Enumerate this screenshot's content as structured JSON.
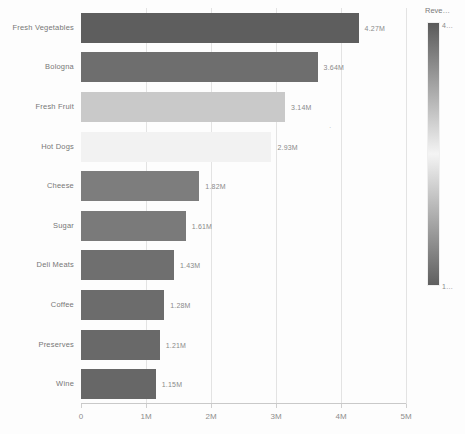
{
  "chart_data": {
    "type": "bar",
    "orientation": "horizontal",
    "title": "",
    "xlabel": "",
    "ylabel": "",
    "categories": [
      "Fresh Vegetables",
      "Bologna",
      "Fresh Fruit",
      "Hot Dogs",
      "Cheese",
      "Sugar",
      "Deli Meats",
      "Coffee",
      "Preserves",
      "Wine"
    ],
    "values": [
      4.27,
      3.64,
      3.14,
      2.93,
      1.82,
      1.61,
      1.43,
      1.28,
      1.21,
      1.15
    ],
    "value_labels": [
      "4.27M",
      "3.64M",
      "3.14M",
      "2.93M",
      "1.82M",
      "1.61M",
      "1.43M",
      "1.28M",
      "1.21M",
      "1.15M"
    ],
    "bar_colors": [
      "#5e5e5e",
      "#6e6e6e",
      "#c9c9c9",
      "#f2f2f2",
      "#7d7d7d",
      "#7a7a7a",
      "#6f6f6f",
      "#6c6c6c",
      "#696969",
      "#676767"
    ],
    "xlim": [
      0,
      5
    ],
    "xticks": [
      0,
      1,
      2,
      3,
      4,
      5
    ],
    "xtick_labels": [
      "0",
      "1M",
      "2M",
      "3M",
      "4M",
      "5M"
    ],
    "grid": true,
    "grid_axis": "x",
    "legend_position": "right"
  },
  "legend": {
    "title": "Reve…",
    "top_label": "4…",
    "bottom_label": "1…",
    "gradient_top": "#5a5a5a",
    "gradient_mid": "#f4f4f4",
    "gradient_bottom": "#5f5f5f"
  },
  "stray": {
    "mark": "·"
  }
}
